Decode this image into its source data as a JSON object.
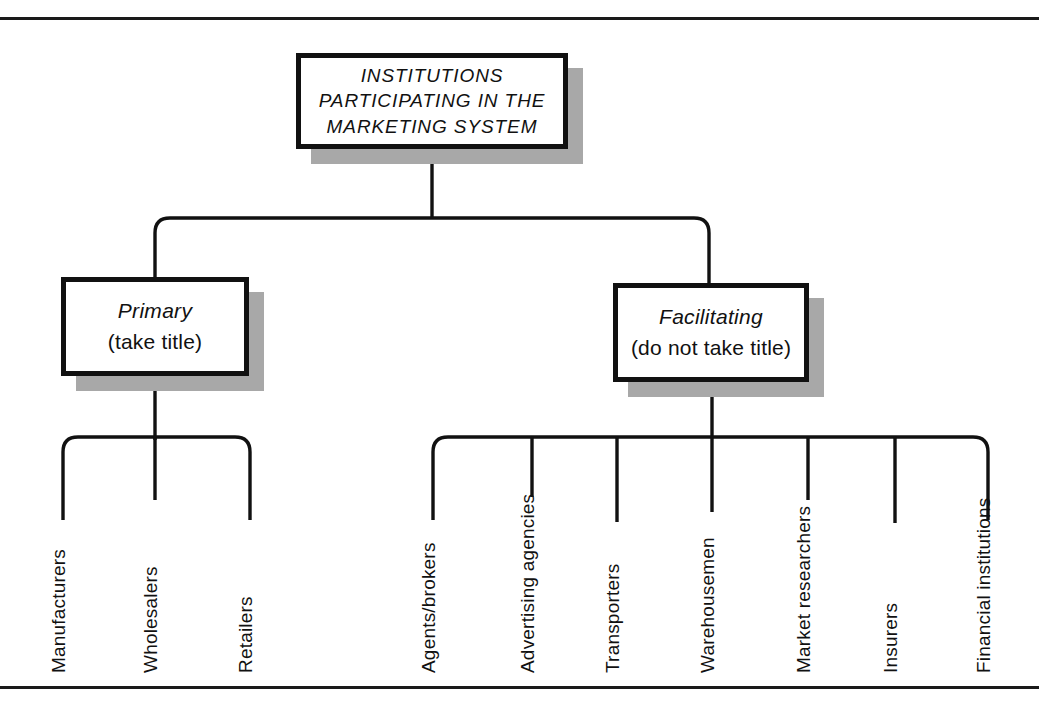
{
  "figure": {
    "root": {
      "lines": [
        "INSTITUTIONS",
        "PARTICIPATING IN THE",
        "MARKETING SYSTEM"
      ]
    },
    "branches": [
      {
        "title": "Primary",
        "subtitle": "(take title)",
        "leaves": [
          "Manufacturers",
          "Wholesalers",
          "Retailers"
        ]
      },
      {
        "title": "Facilitating",
        "subtitle": "(do not take title)",
        "leaves": [
          "Agents/brokers",
          "Advertising agencies",
          "Transporters",
          "Warehousemen",
          "Market researchers",
          "Insurers",
          "Financial institutions"
        ]
      }
    ],
    "colors": {
      "ink": "#111111",
      "shadow": "#a8a8a8",
      "paper": "#ffffff"
    }
  }
}
